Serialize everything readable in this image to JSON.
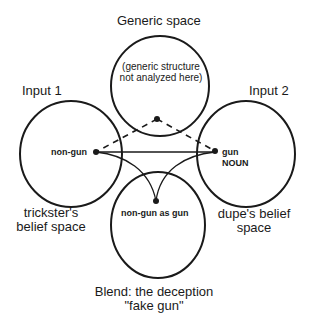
{
  "diagram": {
    "type": "conceptual blending network",
    "colors": {
      "stroke": "#1a1a1a",
      "background": "#ffffff"
    },
    "spaces": {
      "generic": {
        "title": "Generic space",
        "note_line1": "(generic structure",
        "note_line2": "not analyzed here)"
      },
      "input1": {
        "title": "Input 1",
        "element": "non-gun",
        "caption_line1": "trickster's",
        "caption_line2": "belief space"
      },
      "input2": {
        "title": "Input 2",
        "element": "gun",
        "element_sub": "NOUN",
        "caption_line1": "dupe's belief",
        "caption_line2": "space"
      },
      "blend": {
        "element": "non-gun as gun",
        "caption_line1": "Blend: the deception",
        "caption_line2": "\"fake gun\""
      }
    },
    "connections": [
      {
        "from": "generic",
        "to": "input1",
        "style": "dashed"
      },
      {
        "from": "generic",
        "to": "input2",
        "style": "dashed"
      },
      {
        "from": "input1",
        "to": "input2",
        "style": "solid",
        "kind": "cross-space mapping"
      },
      {
        "from": "input1",
        "to": "blend",
        "style": "solid-curve"
      },
      {
        "from": "input2",
        "to": "blend",
        "style": "solid-curve"
      }
    ]
  }
}
